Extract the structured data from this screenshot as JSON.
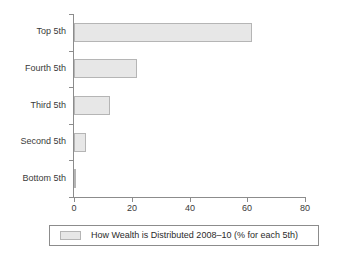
{
  "chart_data": {
    "type": "bar",
    "orientation": "horizontal",
    "title": "",
    "xlabel": "",
    "ylabel": "",
    "categories": [
      "Bottom 5th",
      "Second 5th",
      "Third 5th",
      "Fourth 5th",
      "Top 5th"
    ],
    "values": [
      0.8,
      4.1,
      12.5,
      21.8,
      61.6
    ],
    "xlim": [
      0,
      80
    ],
    "xticks": [
      0,
      20,
      40,
      60,
      80
    ],
    "xtick_labels": [
      "0",
      "20",
      "40",
      "60",
      "80"
    ],
    "grid": false,
    "legend_position": "bottom",
    "series": [
      {
        "name": "How Wealth is Distributed 2008–10 (% for each 5th)",
        "values": [
          0.8,
          4.1,
          12.5,
          21.8,
          61.6
        ],
        "fill_color": "#e7e7e7",
        "border_color": "#b5b5b5"
      }
    ],
    "legend": [
      "How Wealth is Distributed 2008–10 (% for each 5th)"
    ]
  },
  "axis": {
    "line_color": "#8c8c8c"
  },
  "legend": {
    "label": "How Wealth is Distributed 2008–10 (% for each 5th)"
  }
}
